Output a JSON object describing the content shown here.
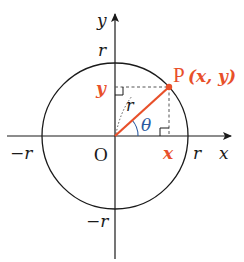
{
  "diagram": {
    "type": "unit-circle-trig-definition",
    "colors": {
      "axis": "#1a1a1a",
      "circle": "#1a1a1a",
      "radius_segment": "#e8502a",
      "point": "#e8502a",
      "highlight_label": "#e8502a",
      "angle_label": "#2a5aa0",
      "dashed": "#555555"
    },
    "labels": {
      "x_axis": "x",
      "y_axis": "y",
      "origin": "O",
      "r_pos_x": "r",
      "r_neg_x": "−r",
      "r_pos_y": "r",
      "r_neg_y": "−r",
      "radius": "r",
      "angle": "θ",
      "point_name": "P",
      "point_coords": "(x, y)",
      "proj_x": "x",
      "proj_y": "y"
    },
    "geometry": {
      "center": [
        115,
        136
      ],
      "radius": 73,
      "point": [
        169,
        87
      ]
    }
  }
}
